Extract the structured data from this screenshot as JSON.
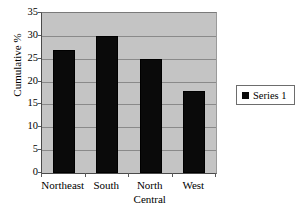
{
  "chart_data": {
    "type": "bar",
    "title": "",
    "subtitle": "",
    "xlabel": "",
    "ylabel": "Cumulative %",
    "categories": [
      "Northeast",
      "South",
      "North Central",
      "West"
    ],
    "category_lines": [
      [
        "Northeast"
      ],
      [
        "South"
      ],
      [
        "North",
        "Central"
      ],
      [
        "West"
      ]
    ],
    "values": [
      27,
      30,
      25,
      18
    ],
    "series": [
      {
        "name": "Series 1",
        "values": [
          27,
          30,
          25,
          18
        ]
      }
    ],
    "ylim": [
      0,
      35
    ],
    "y_ticks": [
      0,
      5,
      10,
      15,
      20,
      25,
      30,
      35
    ],
    "y_tick_labels": [
      "0",
      "5",
      "10",
      "15",
      "20",
      "25",
      "30",
      "35"
    ],
    "grid": true,
    "grid_axis": "y",
    "legend": true,
    "legend_position": "right",
    "legend_entries": [
      "Series 1"
    ],
    "colors": {
      "bar": "#0a0a0a",
      "plot_background": "#c4c4c4",
      "figure_background": "#ffffff",
      "gridline": "#8a8a8a",
      "axis": "#4a4a4a",
      "text": "#000000",
      "legend_border": "#6d6d6d"
    }
  },
  "axes": {
    "y_title": "Cumulative %"
  },
  "legend": {
    "series_1_label": "Series 1"
  }
}
